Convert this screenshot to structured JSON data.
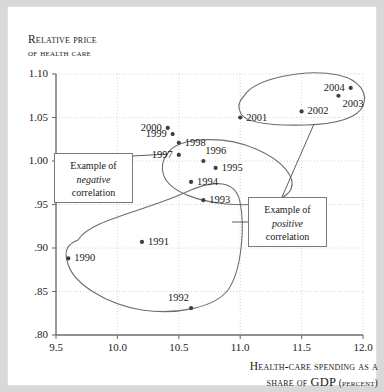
{
  "figure": {
    "y_axis_title_line1": "Relative price",
    "y_axis_title_line2": "of health care",
    "x_axis_title_line1": "Health-care spending as a",
    "x_axis_title_line2_a": "share of ",
    "x_axis_title_line2_b": "GDP",
    "x_axis_title_line2_c": " (percent)"
  },
  "annotations": {
    "negative": {
      "line1": "Example of",
      "line2": "negative",
      "line3": "correlation"
    },
    "positive": {
      "line1": "Example of",
      "line2": "positive",
      "line3": "correlation"
    }
  },
  "colors": {
    "point": "#3f3f3f",
    "axis": "#6e6e6e",
    "grid": "#cfcfcf",
    "outline": "#6e6e6e",
    "frame": "#d8d8d8",
    "text": "#1a1a1a"
  },
  "chart_data": {
    "type": "scatter",
    "title": "",
    "xlabel": "Health-care spending as a share of GDP (percent)",
    "ylabel": "Relative price of health care",
    "xlim": [
      9.5,
      12.0
    ],
    "ylim": [
      0.8,
      1.1
    ],
    "grid": true,
    "legend": "none",
    "xticks": [
      "9.5",
      "10.0",
      "10.5",
      "11.0",
      "11.5",
      "12.0"
    ],
    "xtick_values": [
      9.5,
      10.0,
      10.5,
      11.0,
      11.5,
      12.0
    ],
    "yticks": [
      "1.10",
      "1.05",
      "1.00",
      ".95",
      ".90",
      ".85",
      ".80"
    ],
    "ytick_values": [
      1.1,
      1.05,
      1.0,
      0.95,
      0.9,
      0.85,
      0.8
    ],
    "point_labels": [
      "1990",
      "1991",
      "1992",
      "1993",
      "1994",
      "1995",
      "1996",
      "1997",
      "1998",
      "1999",
      "2000",
      "2001",
      "2002",
      "2003",
      "2004"
    ],
    "points": [
      {
        "label": "1990",
        "x": 9.6,
        "y": 0.888,
        "label_side": "right"
      },
      {
        "label": "1991",
        "x": 10.2,
        "y": 0.907,
        "label_side": "right"
      },
      {
        "label": "1992",
        "x": 10.6,
        "y": 0.831,
        "label_side": "above-left"
      },
      {
        "label": "1993",
        "x": 10.7,
        "y": 0.955,
        "label_side": "right"
      },
      {
        "label": "1994",
        "x": 10.6,
        "y": 0.976,
        "label_side": "right"
      },
      {
        "label": "1995",
        "x": 10.8,
        "y": 0.992,
        "label_side": "right"
      },
      {
        "label": "1996",
        "x": 10.7,
        "y": 1.0,
        "label_side": "above-right"
      },
      {
        "label": "1997",
        "x": 10.5,
        "y": 1.007,
        "label_side": "left"
      },
      {
        "label": "1998",
        "x": 10.5,
        "y": 1.021,
        "label_side": "right"
      },
      {
        "label": "1999",
        "x": 10.45,
        "y": 1.031,
        "label_side": "left"
      },
      {
        "label": "2000",
        "x": 10.41,
        "y": 1.038,
        "label_side": "left"
      },
      {
        "label": "2001",
        "x": 11.0,
        "y": 1.05,
        "label_side": "right"
      },
      {
        "label": "2002",
        "x": 11.5,
        "y": 1.057,
        "label_side": "right"
      },
      {
        "label": "2003",
        "x": 11.8,
        "y": 1.075,
        "label_side": "below-right"
      },
      {
        "label": "2004",
        "x": 11.9,
        "y": 1.084,
        "label_side": "left"
      }
    ],
    "groups": [
      {
        "name": "negative-correlation-group",
        "members": [
          "1995",
          "1996",
          "1997",
          "1998",
          "1999",
          "2000"
        ]
      },
      {
        "name": "positive-correlation-lower-group",
        "members": [
          "1990",
          "1991",
          "1992",
          "1993"
        ]
      },
      {
        "name": "positive-correlation-upper-group",
        "members": [
          "2001",
          "2002",
          "2003",
          "2004"
        ]
      }
    ]
  }
}
